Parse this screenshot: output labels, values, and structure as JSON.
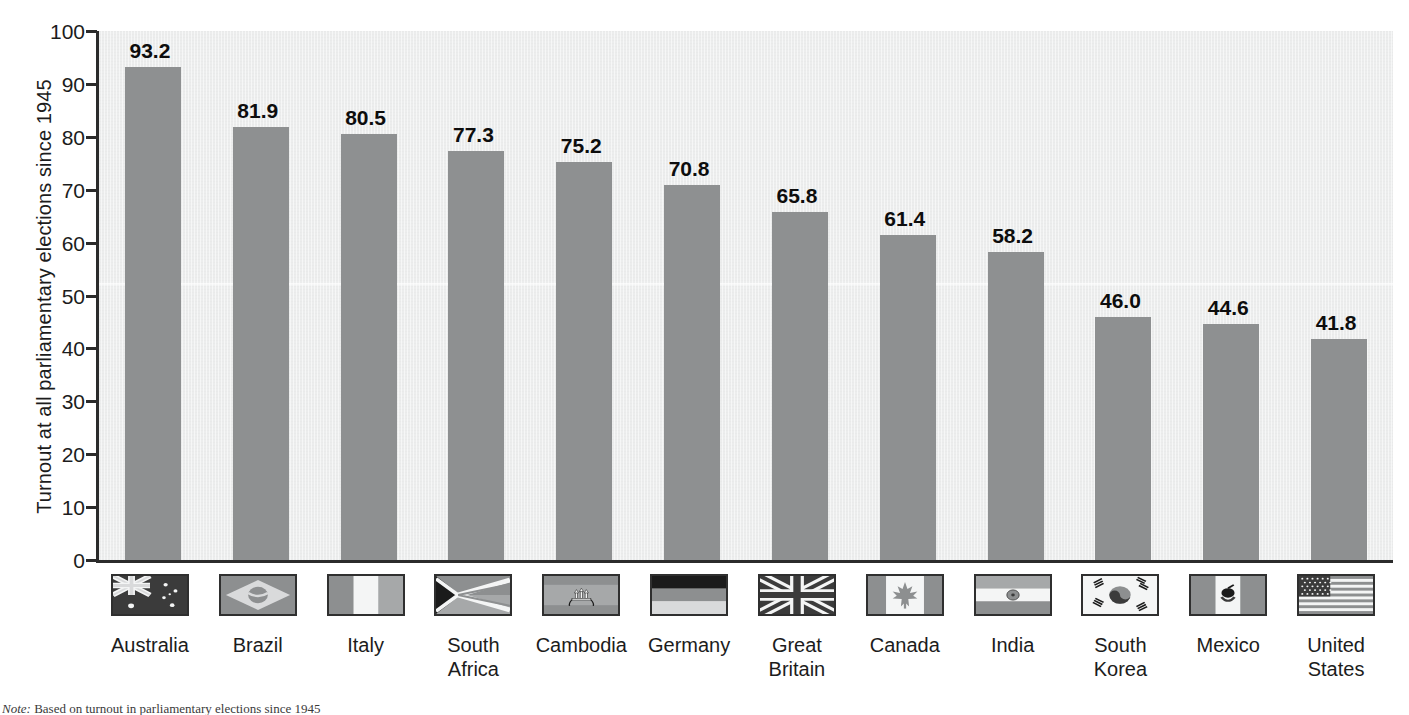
{
  "chart_data": {
    "type": "bar",
    "title": "",
    "xlabel": "",
    "ylabel": "Turnout at all parliamentary elections since 1945",
    "ylim": [
      0,
      100
    ],
    "yticks": [
      0,
      10,
      20,
      30,
      40,
      50,
      60,
      70,
      80,
      90,
      100
    ],
    "ytick_labels": [
      "0",
      "10",
      "20",
      "30",
      "40",
      "50",
      "60",
      "70",
      "80",
      "90",
      "100"
    ],
    "grid": false,
    "legend": "none",
    "categories": [
      "Australia",
      "Brazil",
      "Italy",
      "South Africa",
      "Cambodia",
      "Germany",
      "Great Britain",
      "Canada",
      "India",
      "South Korea",
      "Mexico",
      "United States"
    ],
    "values": [
      93.2,
      81.9,
      80.5,
      77.3,
      75.2,
      70.8,
      65.8,
      61.4,
      58.2,
      46.0,
      44.6,
      41.8
    ],
    "value_labels": [
      "93.2",
      "81.9",
      "80.5",
      "77.3",
      "75.2",
      "70.8",
      "65.8",
      "61.4",
      "58.2",
      "46.0",
      "44.6",
      "41.8"
    ],
    "bar_color": "#8e9091",
    "plot_background": "#eceded",
    "axis_color": "#2b2b2b"
  },
  "bars": [
    {
      "label": "Australia",
      "label_line1": "Australia",
      "label_line2": "",
      "value": 93.2,
      "value_label": "93.2",
      "flag": "flag-australia"
    },
    {
      "label": "Brazil",
      "label_line1": "Brazil",
      "label_line2": "",
      "value": 81.9,
      "value_label": "81.9",
      "flag": "flag-brazil"
    },
    {
      "label": "Italy",
      "label_line1": "Italy",
      "label_line2": "",
      "value": 80.5,
      "value_label": "80.5",
      "flag": "flag-italy"
    },
    {
      "label": "South Africa",
      "label_line1": "South",
      "label_line2": "Africa",
      "value": 77.3,
      "value_label": "77.3",
      "flag": "flag-south-africa"
    },
    {
      "label": "Cambodia",
      "label_line1": "Cambodia",
      "label_line2": "",
      "value": 75.2,
      "value_label": "75.2",
      "flag": "flag-cambodia"
    },
    {
      "label": "Germany",
      "label_line1": "Germany",
      "label_line2": "",
      "value": 70.8,
      "value_label": "70.8",
      "flag": "flag-germany"
    },
    {
      "label": "Great Britain",
      "label_line1": "Great",
      "label_line2": "Britain",
      "value": 65.8,
      "value_label": "65.8",
      "flag": "flag-great-britain"
    },
    {
      "label": "Canada",
      "label_line1": "Canada",
      "label_line2": "",
      "value": 61.4,
      "value_label": "61.4",
      "flag": "flag-canada"
    },
    {
      "label": "India",
      "label_line1": "India",
      "label_line2": "",
      "value": 58.2,
      "value_label": "58.2",
      "flag": "flag-india"
    },
    {
      "label": "South Korea",
      "label_line1": "South",
      "label_line2": "Korea",
      "value": 46.0,
      "value_label": "46.0",
      "flag": "flag-south-korea"
    },
    {
      "label": "Mexico",
      "label_line1": "Mexico",
      "label_line2": "",
      "value": 44.6,
      "value_label": "44.6",
      "flag": "flag-mexico"
    },
    {
      "label": "United States",
      "label_line1": "United",
      "label_line2": "States",
      "value": 41.8,
      "value_label": "41.8",
      "flag": "flag-united-states"
    }
  ],
  "footnote": {
    "prefix": "Note:",
    "text": "Based on turnout in parliamentary elections since 1945"
  }
}
